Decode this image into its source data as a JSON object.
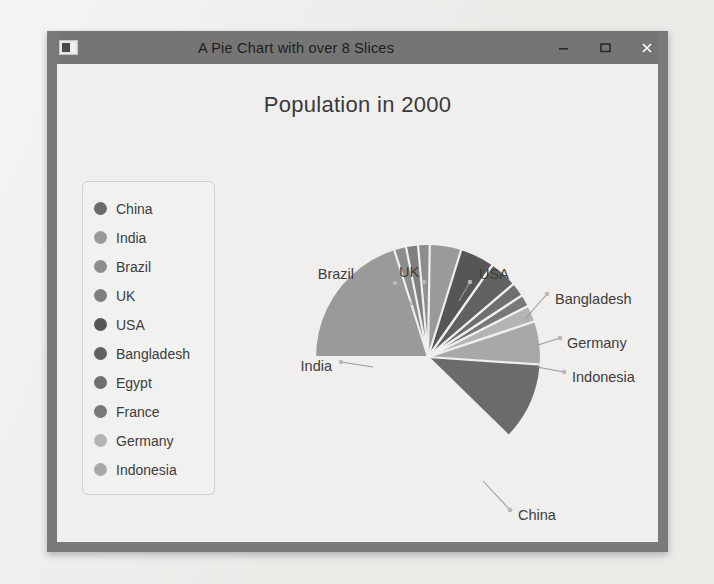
{
  "window": {
    "title": "A Pie Chart with over 8 Slices",
    "icon_name": "app-window-icon",
    "controls": {
      "minimize_label": "–",
      "maximize_label": "☐",
      "close_label": "×"
    }
  },
  "chart_data": {
    "type": "pie",
    "title": "Population in 2000",
    "xlabel": "",
    "ylabel": "",
    "legend_position": "left",
    "grid": false,
    "start_angle_deg": 90,
    "direction": "clockwise",
    "labels": [
      "China",
      "India",
      "Brazil",
      "UK",
      "USA",
      "Bangladesh",
      "Egypt",
      "France",
      "Germany",
      "Indonesia"
    ],
    "categories": [
      "China",
      "India",
      "Brazil",
      "UK",
      "USA",
      "Bangladesh",
      "Egypt",
      "France",
      "Germany",
      "Indonesia"
    ],
    "values": [
      1275,
      1017,
      174,
      59,
      285,
      138,
      70,
      59,
      82,
      212
    ],
    "percentages": [
      37.3,
      29.8,
      5.1,
      1.7,
      8.3,
      4.0,
      2.0,
      1.7,
      2.4,
      6.2
    ],
    "colors": [
      "#6b6b6b",
      "#9a9a9a",
      "#8d8d8d",
      "#7f7f7f",
      "#565656",
      "#616161",
      "#6f6f6f",
      "#787878",
      "#b4b4b4",
      "#a8a8a8"
    ],
    "slices": [
      {
        "name": "China",
        "value": 1275,
        "percent": 37.3,
        "color": "#6b6b6b",
        "start_deg": 90,
        "sweep_deg": 134.3
      },
      {
        "name": "Bangladesh",
        "value": 138,
        "percent": 4.0,
        "color": "#616161",
        "start_deg": 55.0,
        "sweep_deg": 14.5
      },
      {
        "name": "Egypt",
        "value": 70,
        "percent": 2.0,
        "color": "#6f6f6f",
        "start_deg": 40.5,
        "sweep_deg": 7.3
      },
      {
        "name": "France",
        "value": 59,
        "percent": 1.7,
        "color": "#787878",
        "start_deg": 33.2,
        "sweep_deg": 6.2
      },
      {
        "name": "Germany",
        "value": 82,
        "percent": 2.4,
        "color": "#b4b4b4",
        "start_deg": 27.0,
        "sweep_deg": 8.6
      },
      {
        "name": "Indonesia",
        "value": 212,
        "percent": 6.2,
        "color": "#a8a8a8",
        "start_deg": 18.4,
        "sweep_deg": 22.3
      },
      {
        "name": "USA",
        "value": 285,
        "percent": 8.3,
        "color": "#565656",
        "start_deg": 74.4,
        "sweep_deg": 19.4
      },
      {
        "name": "India",
        "value": 1017,
        "percent": 29.8,
        "color": "#9a9a9a",
        "start_deg": 180.0,
        "sweep_deg": 107.2
      },
      {
        "name": "Brazil",
        "value": 174,
        "percent": 5.1,
        "color": "#8d8d8d",
        "start_deg": 107.5,
        "sweep_deg": 18.4
      },
      {
        "name": "UK",
        "value": 59,
        "percent": 1.7,
        "color": "#7f7f7f",
        "start_deg": 101.3,
        "sweep_deg": 6.2
      }
    ],
    "callout_labels": [
      {
        "name": "Brazil",
        "text": "Brazil"
      },
      {
        "name": "UK",
        "text": "UK"
      },
      {
        "name": "USA",
        "text": "USA"
      },
      {
        "name": "Bangladesh",
        "text": "Bangladesh"
      },
      {
        "name": "Germany",
        "text": "Germany"
      },
      {
        "name": "Indonesia",
        "text": "Indonesia"
      },
      {
        "name": "India",
        "text": "India"
      },
      {
        "name": "China",
        "text": "China"
      }
    ]
  },
  "legend": {
    "items": [
      {
        "label": "China",
        "color": "#6b6b6b"
      },
      {
        "label": "India",
        "color": "#9a9a9a"
      },
      {
        "label": "Brazil",
        "color": "#8d8d8d"
      },
      {
        "label": "UK",
        "color": "#7f7f7f"
      },
      {
        "label": "USA",
        "color": "#565656"
      },
      {
        "label": "Bangladesh",
        "color": "#616161"
      },
      {
        "label": "Egypt",
        "color": "#6f6f6f"
      },
      {
        "label": "France",
        "color": "#787878"
      },
      {
        "label": "Germany",
        "color": "#b4b4b4"
      },
      {
        "label": "Indonesia",
        "color": "#a8a8a8"
      }
    ]
  }
}
